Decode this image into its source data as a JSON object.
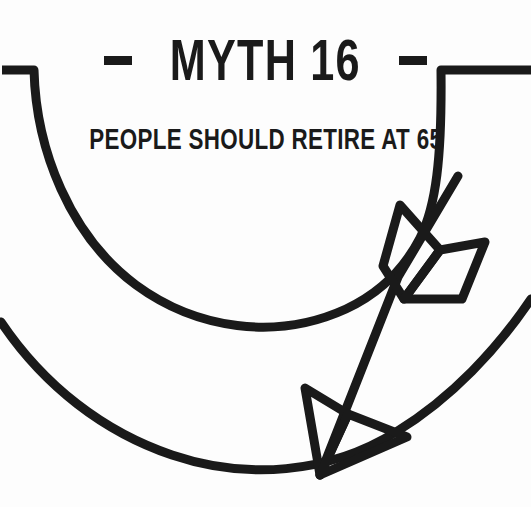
{
  "illustration": {
    "title_dash_left": "-",
    "title_text": "MYTH 16",
    "title_dash_right": "-",
    "title_full": "- MYTH 16 -",
    "subtitle": "PEOPLE SHOULD RETIRE AT 65",
    "icon_name": "arrow-with-fletching",
    "colors": {
      "ink": "#1a1a1a",
      "background": "#fdfdfd"
    },
    "elements": {
      "upper_arc": "upper-sweeping-arc",
      "lower_arc": "lower-sweeping-arc",
      "arrow_shaft": "arrow-shaft",
      "fletching_left": "fletching-left-diamond",
      "fletching_right": "fletching-right-diamond",
      "arrowhead_left_barb": "arrowhead-left-barb",
      "arrowhead_right_barb": "arrowhead-right-barb"
    }
  }
}
